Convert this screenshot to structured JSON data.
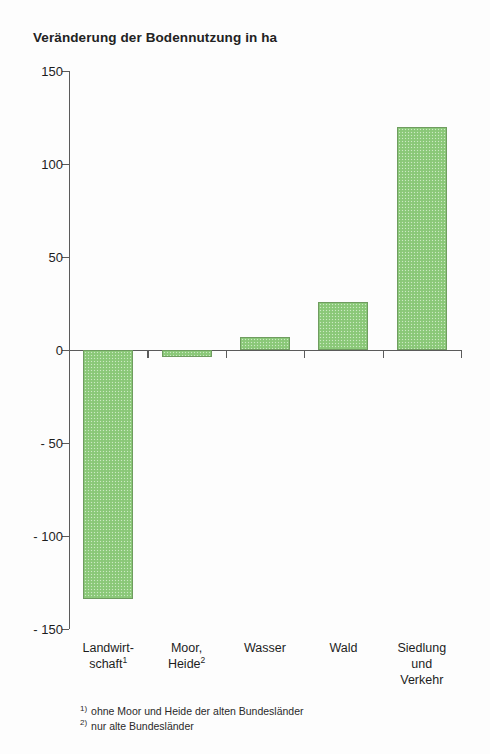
{
  "chart_data": {
    "type": "bar",
    "title": "Veränderung der Bodennutzung in ha",
    "xlabel": "",
    "ylabel": "",
    "ylim": [
      -150,
      150
    ],
    "ytick_labels": [
      "150",
      "100",
      "50",
      "0",
      "- 50",
      "- 100",
      "- 150"
    ],
    "ytick_values": [
      150,
      100,
      50,
      0,
      -50,
      -100,
      -150
    ],
    "grid": false,
    "legend": null,
    "categories": [
      "Landwirt-\nschaft",
      "Moor,\nHeide",
      "Wasser",
      "Wald",
      "Siedlung\nund\nVerkehr"
    ],
    "category_markers": [
      "1",
      "2",
      "",
      "",
      ""
    ],
    "values": [
      -134,
      -4,
      7,
      26,
      120
    ],
    "bar_color": "#8ecb7c",
    "bar_edge_color": "#6f9c60",
    "axis_color": "#5b5b5b"
  },
  "footnotes": [
    {
      "marker": "1)",
      "text": "ohne Moor und Heide der alten Bundesländer"
    },
    {
      "marker": "2)",
      "text": "nur alte Bundesländer"
    }
  ]
}
